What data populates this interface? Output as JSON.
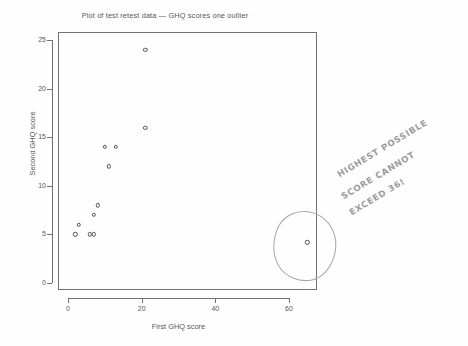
{
  "chart_data": {
    "type": "scatter",
    "title": "Plot of test retest data — GHQ scores one outlier",
    "xlabel": "First GHQ score",
    "ylabel": "Second GHQ score",
    "xlim": [
      -1,
      69
    ],
    "ylim": [
      -0.6,
      26
    ],
    "xticks": [
      0,
      20,
      40,
      60
    ],
    "yticks": [
      0,
      5,
      10,
      15,
      20,
      25
    ],
    "grid": false,
    "legend": "none",
    "marker": "open-circle",
    "points": [
      {
        "x": 2,
        "y": 5
      },
      {
        "x": 3,
        "y": 6
      },
      {
        "x": 6,
        "y": 5
      },
      {
        "x": 7,
        "y": 5
      },
      {
        "x": 7,
        "y": 7
      },
      {
        "x": 8,
        "y": 8
      },
      {
        "x": 10,
        "y": 14
      },
      {
        "x": 11,
        "y": 12
      },
      {
        "x": 13,
        "y": 14
      },
      {
        "x": 21,
        "y": 24
      },
      {
        "x": 21,
        "y": 16
      },
      {
        "x": 65,
        "y": 4.2
      }
    ],
    "annotations": [
      {
        "kind": "pencil-circle",
        "target_point": {
          "x": 65,
          "y": 4.2
        },
        "note": "hand-drawn ring around the far-right outlier"
      },
      {
        "kind": "handwritten-note",
        "lines": [
          "HIGHEST POSSIBLE",
          "SCORE CANNOT",
          "EXCEED 36!"
        ]
      }
    ]
  },
  "annotation": {
    "line1": "HIGHEST POSSIBLE",
    "line2": "SCORE CANNOT",
    "line3": "EXCEED 36!"
  },
  "colors": {
    "axis": "#6f7276",
    "text": "#55585c",
    "marker": "#4e5155",
    "pencil": "#9a9ba0",
    "background": "#fefefe"
  }
}
